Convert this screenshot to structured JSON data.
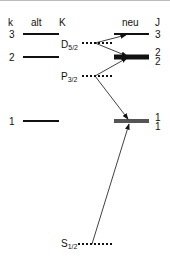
{
  "headers": {
    "k": "k",
    "alt": "alt",
    "K": "K",
    "neu": "neu",
    "J": "J"
  },
  "alt_levels": [
    {
      "k": "3"
    },
    {
      "k": "2"
    },
    {
      "k": "1"
    }
  ],
  "neu_levels": [
    {
      "J": "3"
    },
    {
      "J_top": "2",
      "J_bottom": "2"
    },
    {
      "J_top": "1",
      "J_bottom": "1"
    }
  ],
  "states": [
    {
      "base": "D",
      "sub": "5/2"
    },
    {
      "base": "P",
      "sub": "3/2"
    },
    {
      "base": "S",
      "sub": "1/2"
    }
  ]
}
